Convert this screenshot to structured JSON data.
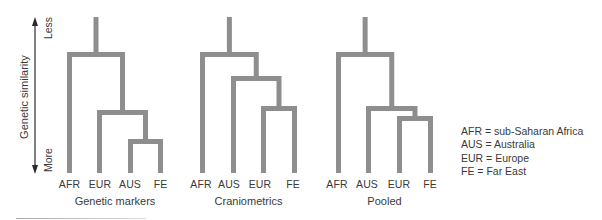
{
  "axis": {
    "title": "Genetic similarity",
    "top_label": "Less",
    "bottom_label": "More"
  },
  "dendrograms": [
    {
      "title": "Genetic markers",
      "leaves": [
        {
          "label": "AFR",
          "x": 69.5
        },
        {
          "label": "EUR",
          "x": 99.5
        },
        {
          "label": "AUS",
          "x": 130.5
        },
        {
          "label": "FE",
          "x": 160.5
        }
      ],
      "merges": [
        {
          "children": [
            "AUS",
            "FE"
          ],
          "y": 141.5
        },
        {
          "children": [
            "EUR",
            "m0"
          ],
          "y": 112.5
        },
        {
          "children": [
            "AFR",
            "m1"
          ],
          "y": 54.5
        }
      ]
    },
    {
      "title": "Craniometrics",
      "leaves": [
        {
          "label": "AFR",
          "x": 202.5
        },
        {
          "label": "AUS",
          "x": 233.5
        },
        {
          "label": "EUR",
          "x": 263.5
        },
        {
          "label": "FE",
          "x": 294.5
        }
      ],
      "merges": [
        {
          "children": [
            "EUR",
            "FE"
          ],
          "y": 108.5
        },
        {
          "children": [
            "AUS",
            "m0"
          ],
          "y": 78.5
        },
        {
          "children": [
            "AFR",
            "m1"
          ],
          "y": 54.5
        }
      ]
    },
    {
      "title": "Pooled",
      "leaves": [
        {
          "label": "AFR",
          "x": 338.5
        },
        {
          "label": "AUS",
          "x": 368.5
        },
        {
          "label": "EUR",
          "x": 399.5
        },
        {
          "label": "FE",
          "x": 430.5
        }
      ],
      "merges": [
        {
          "children": [
            "EUR",
            "FE"
          ],
          "y": 118.5
        },
        {
          "children": [
            "AUS",
            "m0"
          ],
          "y": 108.5
        },
        {
          "children": [
            "AFR",
            "m1"
          ],
          "y": 54.5
        }
      ]
    }
  ],
  "legend": [
    {
      "abbr": "AFR",
      "meaning": "sub-Saharan Africa",
      "text": "AFR = sub-Saharan Africa"
    },
    {
      "abbr": "AUS",
      "meaning": "Australia",
      "text": "AUS = Australia"
    },
    {
      "abbr": "EUR",
      "meaning": "Europe",
      "text": "EUR = Europe"
    },
    {
      "abbr": "FE",
      "meaning": "Far East",
      "text": "FE = Far East"
    }
  ],
  "colors": {
    "branch": "#8e8e8e",
    "text": "#3a3a3a",
    "axis": "#2a2a2a"
  }
}
